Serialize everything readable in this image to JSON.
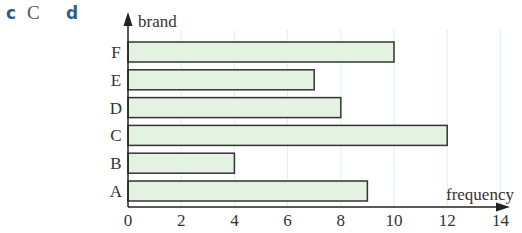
{
  "header": {
    "labels": [
      "c",
      "C",
      "d"
    ]
  },
  "colors": {
    "bar_fill": "#e3f2e1",
    "bar_stroke": "#333333",
    "axis": "#222222",
    "grid": "#e3edf0",
    "label_blue": "#2b5f8f"
  },
  "chart_data": {
    "type": "bar",
    "orientation": "horizontal",
    "title": "",
    "categories": [
      "A",
      "B",
      "C",
      "D",
      "E",
      "F"
    ],
    "values": [
      9,
      4,
      12,
      8,
      7,
      10
    ],
    "xlabel": "frequency",
    "ylabel": "brand",
    "xlim": [
      0,
      14
    ],
    "xticks": [
      0,
      2,
      4,
      6,
      8,
      10,
      12,
      14
    ],
    "grid": "vertical, faint, at each x tick",
    "legend": "none"
  }
}
